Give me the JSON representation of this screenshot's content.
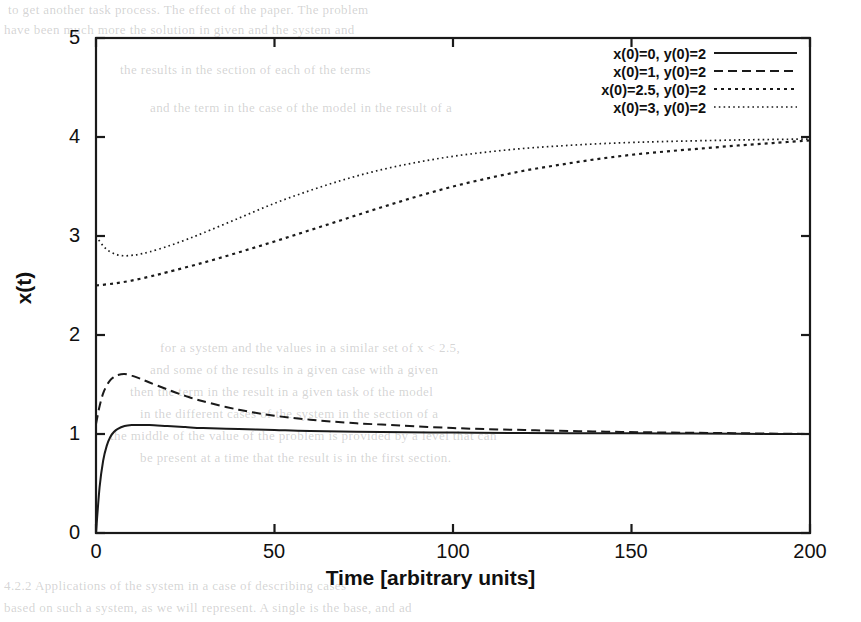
{
  "chart_data": {
    "type": "line",
    "title": "",
    "xlabel": "Time [arbitrary units]",
    "ylabel": "x(t)",
    "xlim": [
      0,
      200
    ],
    "ylim": [
      0,
      5
    ],
    "xticks": [
      0,
      50,
      100,
      150,
      200
    ],
    "yticks": [
      0,
      1,
      2,
      3,
      4,
      5
    ],
    "grid": false,
    "legend_position": "top-right inside axes",
    "series": [
      {
        "name": "x(0)=0, y(0)=2",
        "dash": "solid",
        "initial_value": 0,
        "final_value": 1.0,
        "x": [
          0,
          1,
          2,
          3,
          4,
          5,
          6,
          8,
          10,
          12,
          15,
          20,
          25,
          30,
          40,
          50,
          60,
          80,
          100,
          120,
          140,
          160,
          180,
          200
        ],
        "y": [
          0.0,
          0.46,
          0.73,
          0.88,
          0.97,
          1.02,
          1.05,
          1.08,
          1.09,
          1.09,
          1.09,
          1.08,
          1.07,
          1.06,
          1.05,
          1.04,
          1.03,
          1.02,
          1.015,
          1.01,
          1.008,
          1.005,
          1.002,
          1.0
        ]
      },
      {
        "name": "x(0)=1, y(0)=2",
        "dash": "dashed",
        "initial_value": 1.1,
        "final_value": 1.0,
        "x": [
          0,
          1,
          2,
          3,
          4,
          5,
          6,
          8,
          10,
          12,
          15,
          20,
          25,
          30,
          40,
          50,
          60,
          70,
          80,
          100,
          120,
          140,
          160,
          180,
          200
        ],
        "y": [
          1.1,
          1.28,
          1.41,
          1.49,
          1.545,
          1.575,
          1.595,
          1.605,
          1.59,
          1.565,
          1.52,
          1.45,
          1.385,
          1.33,
          1.245,
          1.185,
          1.145,
          1.115,
          1.095,
          1.06,
          1.04,
          1.025,
          1.015,
          1.008,
          1.0
        ]
      },
      {
        "name": "x(0)=2.5, y(0)=2",
        "dash": "dotted",
        "initial_value": 2.5,
        "final_value": 3.97,
        "x": [
          0,
          5,
          10,
          15,
          20,
          30,
          40,
          50,
          60,
          70,
          80,
          90,
          100,
          110,
          120,
          130,
          140,
          150,
          160,
          170,
          180,
          190,
          200
        ],
        "y": [
          2.5,
          2.52,
          2.55,
          2.59,
          2.635,
          2.73,
          2.835,
          2.945,
          3.06,
          3.175,
          3.29,
          3.4,
          3.5,
          3.585,
          3.66,
          3.72,
          3.775,
          3.82,
          3.855,
          3.885,
          3.915,
          3.94,
          3.965
        ]
      },
      {
        "name": "x(0)=3, y(0)=2",
        "dash": "fine-dotted",
        "initial_value": 3.0,
        "final_value": 3.98,
        "x": [
          0,
          2,
          4,
          6,
          8,
          10,
          12,
          15,
          20,
          25,
          30,
          40,
          50,
          60,
          70,
          80,
          90,
          100,
          110,
          120,
          130,
          140,
          150,
          160,
          180,
          200
        ],
        "y": [
          3.0,
          2.9,
          2.84,
          2.81,
          2.8,
          2.805,
          2.815,
          2.84,
          2.895,
          2.96,
          3.03,
          3.18,
          3.33,
          3.46,
          3.575,
          3.67,
          3.745,
          3.805,
          3.85,
          3.885,
          3.91,
          3.93,
          3.945,
          3.955,
          3.97,
          3.98
        ]
      }
    ]
  },
  "page_bleed": {
    "lines": [
      {
        "text": "to get another task process. The effect of the paper. The problem",
        "x": 8,
        "y": 2,
        "size": 13
      },
      {
        "text": "have been much more the solution in given and the system and",
        "x": 4,
        "y": 22,
        "size": 13
      },
      {
        "text": "the results in the section of each of the terms",
        "x": 120,
        "y": 62,
        "size": 13
      },
      {
        "text": "and the term in the case of the model in the result of a",
        "x": 150,
        "y": 100,
        "size": 13
      },
      {
        "text": "for a system and the values in a similar set of x < 2.5,",
        "x": 160,
        "y": 340,
        "size": 13
      },
      {
        "text": "and some of the results in a given case with a given",
        "x": 150,
        "y": 362,
        "size": 13
      },
      {
        "text": "then the term in the result in a given task of the model",
        "x": 130,
        "y": 384,
        "size": 13
      },
      {
        "text": "in the different cases of the system in the section of a",
        "x": 140,
        "y": 406,
        "size": 13
      },
      {
        "text": "the middle of the value of the problem is provided by a level that can",
        "x": 110,
        "y": 428,
        "size": 13
      },
      {
        "text": "be present at a time that the result is in the first section.",
        "x": 140,
        "y": 450,
        "size": 13
      },
      {
        "text": "4.2.2  Applications of the system in a case of describing cases",
        "x": 4,
        "y": 578,
        "size": 13
      },
      {
        "text": "based on such a system, as we will represent. A single is the base, and ad",
        "x": 4,
        "y": 600,
        "size": 13
      }
    ]
  }
}
